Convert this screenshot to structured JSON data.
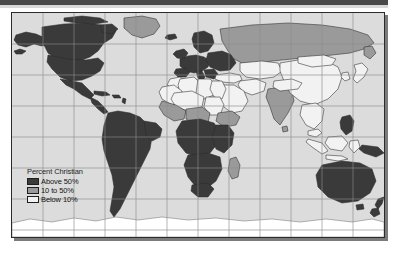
{
  "figure": {
    "kind": "world-choropleth-map",
    "projection": "cylindrical-equirectangular"
  },
  "legend": {
    "title": "Percent Christian",
    "items": [
      {
        "label": "Above 50%",
        "color": "#3a3a3a",
        "range": "above-50"
      },
      {
        "label": "10 to 50%",
        "color": "#9a9a9a",
        "range": "10-to-50"
      },
      {
        "label": "Below 10%",
        "color": "#f2f2f2",
        "range": "below-10"
      }
    ]
  },
  "colors": {
    "ocean": "#dcdcdc",
    "graticule": "#8e8e8e",
    "coastline": "#3a3a3a",
    "border_dark": "#2b2b2b",
    "above_50": "#3a3a3a",
    "mid_10_50": "#9a9a9a",
    "below_10": "#f2f2f2",
    "antarctica": "#ffffff",
    "page": "#ffffff",
    "scan_bar": "#4a4a4a",
    "frame_shadow": "#7b7b7b"
  },
  "graticule": {
    "visible": true,
    "meridian_spacing_px": 31,
    "parallel_spacing_px": 31,
    "meridians_x": [
      31,
      62,
      93,
      124,
      155,
      186,
      217,
      248,
      279,
      310,
      341
    ],
    "parallels_y": [
      31,
      62,
      93,
      124,
      155,
      186,
      217
    ]
  },
  "regions": [
    {
      "name": "Canada",
      "class": "above-50"
    },
    {
      "name": "Alaska",
      "class": "above-50"
    },
    {
      "name": "United States",
      "class": "above-50"
    },
    {
      "name": "Mexico",
      "class": "above-50"
    },
    {
      "name": "Central America",
      "class": "above-50"
    },
    {
      "name": "Caribbean",
      "class": "above-50"
    },
    {
      "name": "Greenland",
      "class": "10-to-50"
    },
    {
      "name": "South America",
      "class": "above-50"
    },
    {
      "name": "Europe",
      "class": "above-50"
    },
    {
      "name": "Scandinavia",
      "class": "above-50"
    },
    {
      "name": "Russia",
      "class": "10-to-50"
    },
    {
      "name": "Turkey",
      "class": "below-10"
    },
    {
      "name": "North Africa",
      "class": "below-10"
    },
    {
      "name": "Egypt",
      "class": "below-10"
    },
    {
      "name": "Libya",
      "class": "below-10"
    },
    {
      "name": "Algeria",
      "class": "below-10"
    },
    {
      "name": "Morocco",
      "class": "below-10"
    },
    {
      "name": "Sahel",
      "class": "10-to-50"
    },
    {
      "name": "Nigeria",
      "class": "10-to-50"
    },
    {
      "name": "Ethiopia",
      "class": "10-to-50"
    },
    {
      "name": "Central Africa",
      "class": "above-50"
    },
    {
      "name": "Southern Africa",
      "class": "above-50"
    },
    {
      "name": "Madagascar",
      "class": "10-to-50"
    },
    {
      "name": "Arabian Peninsula",
      "class": "below-10"
    },
    {
      "name": "Iran",
      "class": "below-10"
    },
    {
      "name": "Central Asia",
      "class": "below-10"
    },
    {
      "name": "India",
      "class": "10-to-50"
    },
    {
      "name": "China",
      "class": "below-10"
    },
    {
      "name": "Mongolia",
      "class": "below-10"
    },
    {
      "name": "Southeast Asia",
      "class": "below-10"
    },
    {
      "name": "Indonesia",
      "class": "below-10"
    },
    {
      "name": "Philippines",
      "class": "above-50"
    },
    {
      "name": "Papua New Guinea",
      "class": "above-50"
    },
    {
      "name": "Japan",
      "class": "below-10"
    },
    {
      "name": "Australia",
      "class": "above-50"
    },
    {
      "name": "New Zealand",
      "class": "above-50"
    },
    {
      "name": "Antarctica",
      "class": "unclassified"
    }
  ]
}
